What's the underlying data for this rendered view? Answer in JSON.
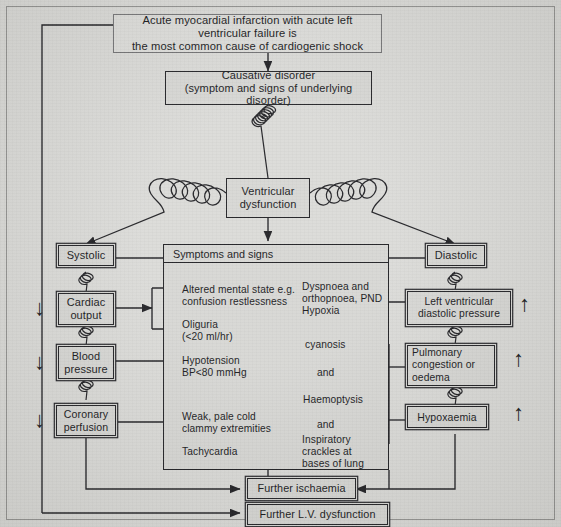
{
  "diagram": {
    "nodes": {
      "premise": "Acute myocardial infarction with acute left ventricular failure is\nthe most common cause of cardiogenic shock",
      "causative": "Causative disorder\n(symptom and signs of underlying disorder)",
      "ventricular": "Ventricular\ndysfunction",
      "systolic": "Systolic",
      "diastolic": "Diastolic",
      "cardiac_output": "Cardiac\noutput",
      "blood_pressure": "Blood\npressure",
      "coronary_perfusion": "Coronary\nperfusion",
      "lv_diastolic_pressure": "Left ventricular\ndiastolic pressure",
      "pulmonary_congestion": "Pulmonary\ncongestion or\noedema",
      "hypoxaemia": "Hypoxaemia",
      "further_ischaemia": "Further ischaemia",
      "further_lv_dysfunction": "Further L.V. dysfunction"
    },
    "symptoms_panel": {
      "header": "Symptoms and signs",
      "left_column": [
        "Altered mental state e.g.\nconfusion restlessness",
        "Oliguria\n(<20 ml/hr)",
        "Hypotension\nBP<80 mmHg",
        "Weak, pale cold\nclammy extremities",
        "Tachycardia"
      ],
      "right_column": [
        "Dyspnoea and\northopnoea, PND\nHypoxia",
        "cyanosis",
        "and",
        "Haemoptysis",
        "and",
        "Inspiratory\ncrackles at\nbases of lung"
      ]
    },
    "trend_markers": {
      "decrease": "↓",
      "increase": "↑",
      "decrease_labels": [
        "Cardiac output decreased",
        "Blood pressure decreased",
        "Coronary perfusion decreased"
      ],
      "increase_labels": [
        "Left ventricular diastolic pressure increased",
        "Pulmonary congestion or oedema increased",
        "Hypoxaemia increased"
      ]
    },
    "colors": {
      "paper": "#d9d9d6",
      "ink": "#0d0d10",
      "box_fill": "#d5d5d2",
      "frame": "#8d8d8b"
    }
  }
}
